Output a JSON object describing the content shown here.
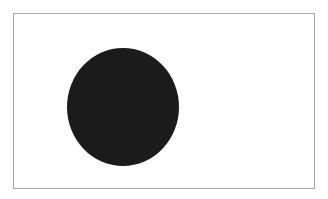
{
  "canvas": {
    "frame": {
      "border_color": "#a8a8a8",
      "background": "#ffffff"
    },
    "shapes": [
      {
        "type": "ellipse",
        "name": "black-circle",
        "fill": "#1b1b1b",
        "cx": 123,
        "cy": 107,
        "rx": 56,
        "ry": 59
      }
    ]
  }
}
